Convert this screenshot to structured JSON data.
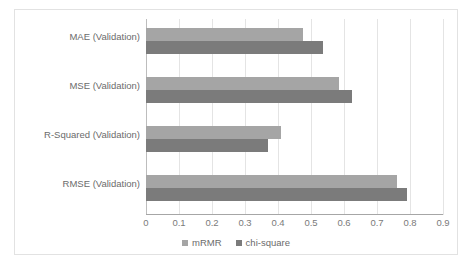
{
  "chart_data": {
    "type": "bar",
    "orientation": "horizontal",
    "title": "",
    "xlabel": "",
    "ylabel": "",
    "categories": [
      "MAE (Validation)",
      "MSE (Validation)",
      "R-Squared (Validation)",
      "RMSE (Validation)"
    ],
    "series": [
      {
        "name": "mRMR",
        "color": "#a5a5a5",
        "values": [
          0.475,
          0.585,
          0.41,
          0.76
        ]
      },
      {
        "name": "chi-square",
        "color": "#7b7b7b",
        "values": [
          0.535,
          0.625,
          0.37,
          0.79
        ]
      }
    ],
    "xlim": [
      0,
      0.9
    ],
    "xticks": [
      0,
      0.1,
      0.2,
      0.3,
      0.4,
      0.5,
      0.6,
      0.7,
      0.8,
      0.9
    ],
    "xtick_labels": [
      "0",
      "0.1",
      "0.2",
      "0.3",
      "0.4",
      "0.5",
      "0.6",
      "0.7",
      "0.8",
      "0.9"
    ],
    "grid": true,
    "grid_axis": "x",
    "legend_position": "bottom"
  },
  "colors": {
    "series_mrmr": "#a5a5a5",
    "series_chi_square": "#7b7b7b",
    "gridline": "#e4e4e4",
    "axis": "#a6a6a6",
    "text": "#6b6b6b",
    "frame_border": "#e2e2e2",
    "background": "#ffffff"
  }
}
